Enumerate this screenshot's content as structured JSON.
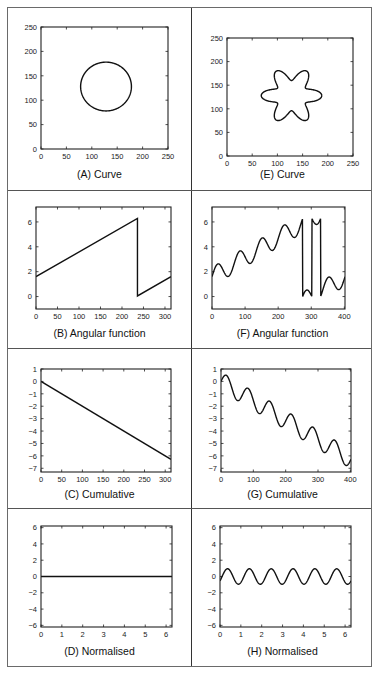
{
  "figure": {
    "panels": [
      {
        "id": "A",
        "caption": "(A) Curve"
      },
      {
        "id": "E",
        "caption": "(E) Curve"
      },
      {
        "id": "B",
        "caption": "(B) Angular function"
      },
      {
        "id": "F",
        "caption": "(F) Angular function"
      },
      {
        "id": "C",
        "caption": "(C) Cumulative"
      },
      {
        "id": "G",
        "caption": "(G) Cumulative"
      },
      {
        "id": "D",
        "caption": "(D) Normalised"
      },
      {
        "id": "H",
        "caption": "(H) Normalised"
      }
    ]
  },
  "chart_data": [
    {
      "id": "A",
      "type": "line",
      "title": "(A) Curve",
      "xlabel": "",
      "ylabel": "",
      "xlim": [
        0,
        250
      ],
      "ylim": [
        0,
        250
      ],
      "xticks": [
        0,
        50,
        100,
        150,
        200,
        250
      ],
      "yticks": [
        0,
        50,
        100,
        150,
        200,
        250
      ],
      "shape": {
        "kind": "circle",
        "cx": 128,
        "cy": 128,
        "r": 50
      },
      "grid": false
    },
    {
      "id": "E",
      "type": "line",
      "title": "(E) Curve",
      "xlabel": "",
      "ylabel": "",
      "xlim": [
        0,
        250
      ],
      "ylim": [
        0,
        250
      ],
      "xticks": [
        0,
        50,
        100,
        150,
        200,
        250
      ],
      "yticks": [
        0,
        50,
        100,
        150,
        200,
        250
      ],
      "shape": {
        "kind": "flower",
        "cx": 128,
        "cy": 128,
        "r": 46,
        "amp": 14,
        "petals": 6
      },
      "grid": false
    },
    {
      "id": "B",
      "type": "line",
      "title": "(B) Angular function",
      "xlabel": "",
      "ylabel": "",
      "xlim": [
        0,
        314
      ],
      "ylim": [
        -1,
        7.2
      ],
      "xticks": [
        0,
        50,
        100,
        150,
        200,
        250,
        300
      ],
      "yticks": [
        0,
        2,
        4,
        6
      ],
      "x": [
        0,
        236,
        236,
        314
      ],
      "y": [
        1.6,
        6.28,
        0.05,
        1.6
      ],
      "grid": false
    },
    {
      "id": "F",
      "type": "line",
      "title": "(F) Angular function",
      "xlabel": "",
      "ylabel": "",
      "xlim": [
        0,
        402
      ],
      "ylim": [
        -1,
        7.2
      ],
      "xticks": [
        0,
        100,
        200,
        300,
        400
      ],
      "yticks": [
        0,
        2,
        4,
        6
      ],
      "generator": {
        "kind": "wrapped_wave",
        "base": 1.6,
        "slope": 0.0156,
        "amp": 0.75,
        "period": 67,
        "wrap": 6.283
      },
      "grid": false
    },
    {
      "id": "C",
      "type": "line",
      "title": "(C) Cumulative",
      "xlabel": "",
      "ylabel": "",
      "xlim": [
        0,
        314
      ],
      "ylim": [
        -7.3,
        1
      ],
      "xticks": [
        0,
        50,
        100,
        150,
        200,
        250,
        300
      ],
      "yticks": [
        1,
        0,
        -1,
        -2,
        -3,
        -4,
        -5,
        -6,
        -7
      ],
      "x": [
        0,
        314
      ],
      "y": [
        0,
        -6.28
      ],
      "grid": false
    },
    {
      "id": "G",
      "type": "line",
      "title": "(G) Cumulative",
      "xlabel": "",
      "ylabel": "",
      "xlim": [
        0,
        402
      ],
      "ylim": [
        -7.3,
        1
      ],
      "xticks": [
        0,
        100,
        200,
        300,
        400
      ],
      "yticks": [
        1,
        0,
        -1,
        -2,
        -3,
        -4,
        -5,
        -6,
        -7
      ],
      "generator": {
        "kind": "wave",
        "slope": -0.0156,
        "amp": 0.75,
        "period": 67
      },
      "grid": false
    },
    {
      "id": "D",
      "type": "line",
      "title": "(D) Normalised",
      "xlabel": "",
      "ylabel": "",
      "xlim": [
        0,
        6.283
      ],
      "ylim": [
        -6.2,
        6.2
      ],
      "xticks": [
        0,
        1,
        2,
        3,
        4,
        5,
        6
      ],
      "yticks": [
        6,
        4,
        2,
        0,
        -2,
        -4,
        -6
      ],
      "x": [
        0,
        6.283
      ],
      "y": [
        0,
        0
      ],
      "grid": false
    },
    {
      "id": "H",
      "type": "line",
      "title": "(H) Normalised",
      "xlabel": "",
      "ylabel": "",
      "xlim": [
        0,
        6.283
      ],
      "ylim": [
        -6.2,
        6.2
      ],
      "xticks": [
        0,
        1,
        2,
        3,
        4,
        5,
        6
      ],
      "yticks": [
        6,
        4,
        2,
        0,
        -2,
        -4,
        -6
      ],
      "generator": {
        "kind": "sine",
        "amp": 0.95,
        "cycles": 6
      },
      "grid": false
    }
  ],
  "style": {
    "line_color": "#111111",
    "frame_color": "#222222",
    "border_color": "#6a6a6a"
  }
}
